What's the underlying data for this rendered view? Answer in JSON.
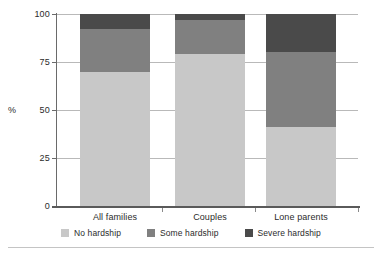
{
  "chart_data": {
    "type": "bar",
    "subtype": "stacked-100-percent",
    "title": "",
    "subtitle": "",
    "xlabel": "",
    "ylabel": "%",
    "ylim": [
      0,
      100
    ],
    "yticks": [
      0,
      25,
      50,
      75,
      100
    ],
    "ytick_labels": [
      "0",
      "25",
      "50",
      "75",
      "100"
    ],
    "grid": true,
    "grid_axis": "y",
    "legend_position": "bottom",
    "orientation": "vertical",
    "categories": [
      "All families",
      "Couples",
      "Lone parents"
    ],
    "series": [
      {
        "name": "No hardship",
        "color": "#c8c8c8",
        "values": [
          70,
          79,
          41
        ]
      },
      {
        "name": "Some hardship",
        "color": "#808080",
        "values": [
          22,
          18,
          39
        ]
      },
      {
        "name": "Severe hardship",
        "color": "#4a4a4a",
        "values": [
          8,
          3,
          20
        ]
      }
    ],
    "annotations": []
  },
  "axis": {
    "unit_label": "%",
    "ticks": [
      {
        "label": "100",
        "value": 100
      },
      {
        "label": "75",
        "value": 75
      },
      {
        "label": "50",
        "value": 50
      },
      {
        "label": "25",
        "value": 25
      },
      {
        "label": "0",
        "value": 0
      }
    ]
  },
  "legend": {
    "items": [
      {
        "label": "No hardship",
        "color": "#c8c8c8"
      },
      {
        "label": "Some hardship",
        "color": "#808080"
      },
      {
        "label": "Severe hardship",
        "color": "#4a4a4a"
      }
    ]
  },
  "categories": [
    {
      "label": "All families"
    },
    {
      "label": "Couples"
    },
    {
      "label": "Lone parents"
    }
  ],
  "colors": {
    "no_hardship": "#c8c8c8",
    "some_hardship": "#808080",
    "severe_hardship": "#4a4a4a",
    "axis": "#5a5a5a",
    "gridline": "#b9b9b9",
    "text": "#2b2b2b",
    "background": "#ffffff"
  }
}
